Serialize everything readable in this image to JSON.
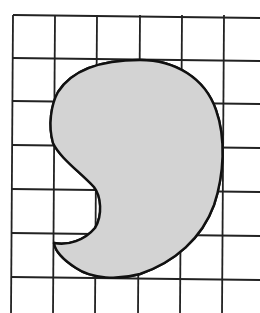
{
  "figure": {
    "description": "Irregular shaded bean/comma-shaped figure drawn over a square grid for area estimation",
    "grid": {
      "columns_visible": 6,
      "rows_visible": 7,
      "vertical_lines_x": [
        13,
        55,
        97,
        140,
        182,
        224
      ],
      "horizontal_lines_y": [
        15,
        58,
        101,
        145,
        189,
        233,
        277
      ],
      "line_color": "#222222"
    },
    "shape": {
      "fill_color": "#d3d3d3",
      "stroke_color": "#111111",
      "path": "M 140 60 C 175 60, 205 78, 216 110 C 226 138, 224 175, 214 205 C 202 238, 175 262, 140 274 C 118 280, 92 279, 76 268 C 62 259, 55 250, 54 243 C 68 246, 85 240, 95 228 C 103 215, 101 196, 94 187 C 80 172, 60 158, 53 143 C 48 125, 51 105, 58 92 C 72 70, 102 60, 140 60 Z"
    }
  }
}
